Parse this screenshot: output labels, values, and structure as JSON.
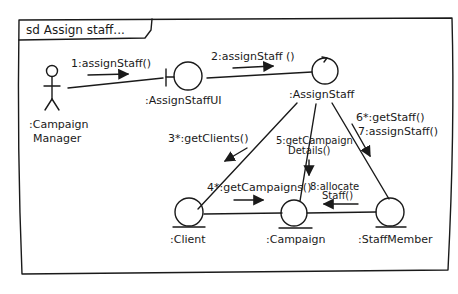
{
  "frame": {
    "label": "sd Assign staff..."
  },
  "lifelines": {
    "actor": {
      "name": ":Campaign",
      "name2": "Manager",
      "stereotype": "actor"
    },
    "boundary": {
      "name": ":AssignStaffUI",
      "stereotype": "boundary"
    },
    "control": {
      "name": ":AssignStaff",
      "stereotype": "control"
    },
    "client": {
      "name": ":Client",
      "stereotype": "entity"
    },
    "campaign": {
      "name": ":Campaign",
      "stereotype": "entity"
    },
    "staff": {
      "name": ":StaffMember",
      "stereotype": "entity"
    }
  },
  "messages": {
    "m1": "1:assignStaff()",
    "m2": "2:assignStaff ()",
    "m3": "3*:getClients()",
    "m4": "4*:getCampaigns()",
    "m5a": "5:getCampaign",
    "m5b": "Details()",
    "m6": "6*:getStaff()",
    "m7": "7:assignStaff()",
    "m8a": "8:allocate",
    "m8b": "Staff()"
  },
  "colors": {
    "ink": "#1a1a1a",
    "paper": "#ffffff"
  }
}
